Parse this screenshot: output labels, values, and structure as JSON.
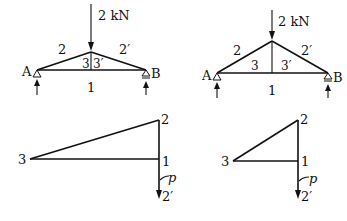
{
  "figures": {
    "truss_left": {
      "load_label": "2 kN",
      "support_left": "A",
      "support_right": "B",
      "member_labels": {
        "top_left": "2",
        "top_right": "2′",
        "inner_left": "3",
        "inner_right": "3′",
        "bottom": "1"
      }
    },
    "truss_right": {
      "load_label": "2 kN",
      "support_left": "A",
      "support_right": "B",
      "member_labels": {
        "top_left": "2",
        "top_right": "2′",
        "inner_left": "3",
        "inner_right": "3′",
        "bottom": "1"
      }
    },
    "polygon_left": {
      "point_labels": {
        "p3": "3",
        "p2": "2",
        "p1": "1",
        "p2prime": "2′"
      },
      "leader_label": "p"
    },
    "polygon_right": {
      "point_labels": {
        "p3": "3",
        "p2": "2",
        "p1": "1",
        "p2prime": "2′"
      },
      "leader_label": "p"
    }
  },
  "colors": {
    "ink": "#111111",
    "background": "#ffffff"
  }
}
